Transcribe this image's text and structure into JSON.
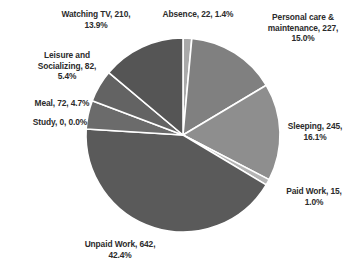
{
  "chart_data": {
    "type": "pie",
    "title": "",
    "xlabel": "",
    "ylabel": "",
    "legend_position": "none",
    "grid": false,
    "total": 1515,
    "start_angle_deg": 0,
    "direction": "clockwise",
    "categories": [
      "Absence",
      "Personal care & maintenance",
      "Sleeping",
      "Paid Work",
      "Unpaid Work",
      "Study",
      "Meal",
      "Leisure and Socializing",
      "Watching TV"
    ],
    "values": [
      22,
      227,
      245,
      15,
      642,
      0,
      72,
      82,
      210
    ],
    "percentages": [
      1.4,
      15.0,
      16.1,
      1.0,
      42.4,
      0.0,
      4.7,
      5.4,
      13.9
    ],
    "colors": [
      "#a9a9a9",
      "#808080",
      "#8e8e8e",
      "#b4b4b4",
      "#5a5a5a",
      "#9a9a9a",
      "#6b6b6b",
      "#636363",
      "#555555"
    ],
    "slices": [
      {
        "name": "Absence",
        "value": 22,
        "percent": 1.4,
        "color": "#a9a9a9",
        "label": "Absence, 22, 1.4%"
      },
      {
        "name": "Personal care & maintenance",
        "value": 227,
        "percent": 15.0,
        "color": "#808080",
        "label": "Personal care &\nmaintenance, 227,\n15.0%"
      },
      {
        "name": "Sleeping",
        "value": 245,
        "percent": 16.1,
        "color": "#8e8e8e",
        "label": "Sleeping, 245,\n16.1%"
      },
      {
        "name": "Paid Work",
        "value": 15,
        "percent": 1.0,
        "color": "#b4b4b4",
        "label": "Paid Work, 15,\n1.0%"
      },
      {
        "name": "Unpaid Work",
        "value": 642,
        "percent": 42.4,
        "color": "#5a5a5a",
        "label": "Unpaid Work, 642,\n42.4%"
      },
      {
        "name": "Study",
        "value": 0,
        "percent": 0.0,
        "color": "#9a9a9a",
        "label": "Study, 0, 0.0%"
      },
      {
        "name": "Meal",
        "value": 72,
        "percent": 4.7,
        "color": "#6b6b6b",
        "label": "Meal, 72, 4.7%"
      },
      {
        "name": "Leisure and Socializing",
        "value": 82,
        "percent": 5.4,
        "color": "#636363",
        "label": "Leisure and\nSocializing, 82,\n5.4%"
      },
      {
        "name": "Watching TV",
        "value": 210,
        "percent": 13.9,
        "color": "#555555",
        "label": "Watching TV, 210,\n13.9%"
      }
    ],
    "separator_color": "#ffffff",
    "background_color": "#ffffff",
    "text_color": "#2b2b2b"
  },
  "geometry": {
    "center_x": 183,
    "center_y": 135,
    "radius": 97
  }
}
